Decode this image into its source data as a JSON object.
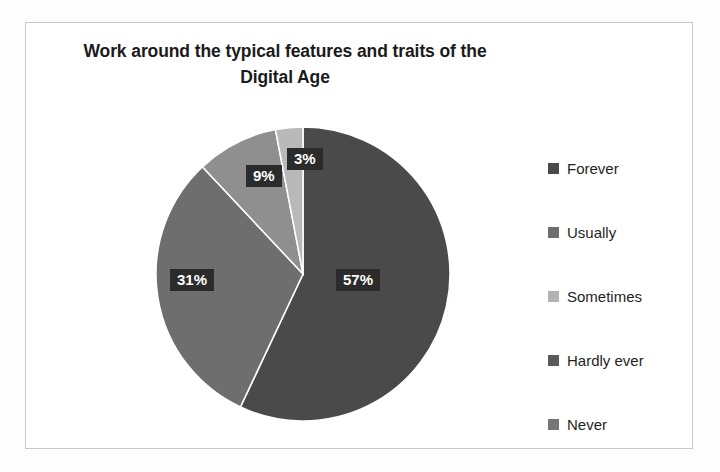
{
  "chart_data": {
    "type": "pie",
    "title": "Work around the typical features and traits of the Digital Age",
    "title_line1": "Work around the typical features and traits of the",
    "title_line2": "Digital Age",
    "categories": [
      "Forever",
      "Usually",
      "Sometimes",
      "Hardly ever",
      "Never"
    ],
    "values": [
      57,
      31,
      9,
      3,
      0
    ],
    "value_labels": [
      "57%",
      "31%",
      "9%",
      "3%",
      ""
    ],
    "unit": "%",
    "colors": [
      "#4a4a4a",
      "#6e6e6e",
      "#8f8f8f",
      "#b9b9b9",
      "#7d7d7d"
    ],
    "legend_position": "right",
    "grid": false,
    "xlabel": "",
    "ylabel": "",
    "start_angle_deg": 0,
    "direction": "clockwise",
    "slices": [
      {
        "name": "Forever",
        "value": 57,
        "label": "57%",
        "color": "#4a4a4a"
      },
      {
        "name": "Usually",
        "value": 31,
        "label": "31%",
        "color": "#6e6e6e"
      },
      {
        "name": "Sometimes",
        "value": 9,
        "label": "9%",
        "color": "#8f8f8f"
      },
      {
        "name": "Hardly ever",
        "value": 3,
        "label": "3%",
        "color": "#b9b9b9"
      },
      {
        "name": "Never",
        "value": 0,
        "label": "",
        "color": "#7d7d7d"
      }
    ]
  },
  "legend": {
    "items": [
      {
        "label": "Forever",
        "color": "#4a4a4a"
      },
      {
        "label": "Usually",
        "color": "#6e6e6e"
      },
      {
        "label": "Sometimes",
        "color": "#b3b3b3"
      },
      {
        "label": "Hardly ever",
        "color": "#5a5a5a"
      },
      {
        "label": "Never",
        "color": "#767676"
      }
    ]
  }
}
